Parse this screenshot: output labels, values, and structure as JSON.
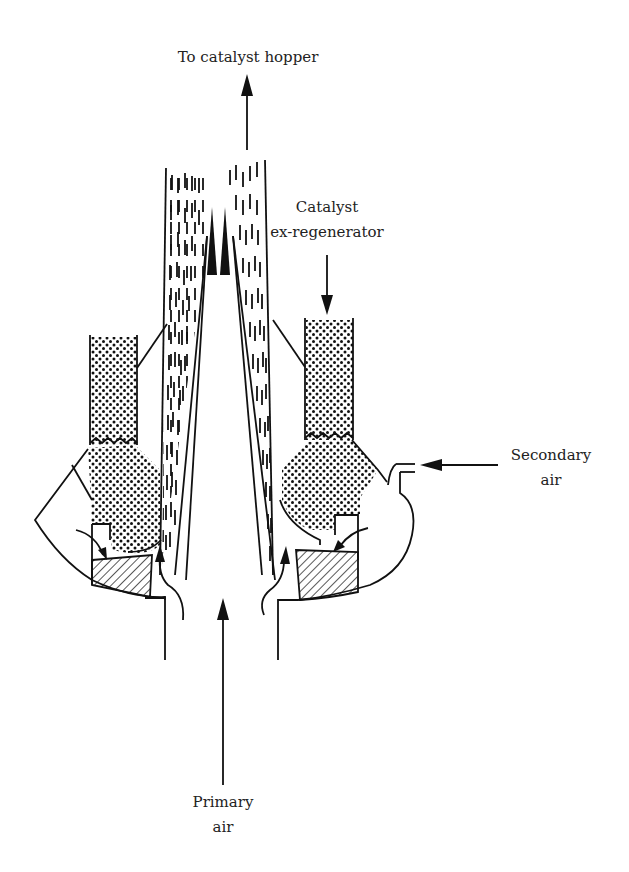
{
  "diagram": {
    "type": "process-schematic",
    "labels": {
      "top": "To catalyst hopper",
      "catalyst_line1": "Catalyst",
      "catalyst_line2": "ex-regenerator",
      "secondary_line1": "Secondary",
      "secondary_line2": "air",
      "primary_line1": "Primary",
      "primary_line2": "air"
    },
    "flows": [
      {
        "name": "catalyst-out",
        "direction": "up",
        "label_ref": "top"
      },
      {
        "name": "catalyst-in",
        "direction": "down",
        "label_ref": "catalyst"
      },
      {
        "name": "secondary-air-in",
        "direction": "left",
        "label_ref": "secondary"
      },
      {
        "name": "primary-air-in",
        "direction": "up",
        "label_ref": "primary"
      }
    ],
    "colors": {
      "line": "#111111",
      "background": "#ffffff"
    }
  }
}
